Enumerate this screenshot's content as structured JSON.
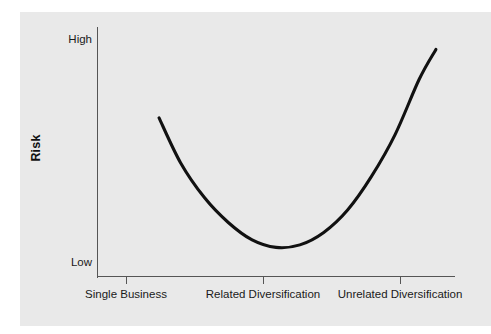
{
  "figure": {
    "background_color": "#ffffff",
    "panel_color": "#e9e9e9",
    "axis_color": "#555555",
    "curve_color": "#111111"
  },
  "axes": {
    "y_title": "Risk",
    "y_ticks": [
      {
        "label": "High"
      },
      {
        "label": "Low"
      }
    ],
    "x_ticks": [
      {
        "label": "Single Business"
      },
      {
        "label": "Related Diversification"
      },
      {
        "label": "Unrelated Diversification"
      }
    ]
  },
  "chart_data": {
    "type": "line",
    "title": "",
    "xlabel": "",
    "ylabel": "Risk",
    "grid": false,
    "legend": null,
    "xlim": [
      0,
      3
    ],
    "ylim": [
      0,
      1
    ],
    "x_tick_labels": [
      "Single Business",
      "Related Diversification",
      "Unrelated Diversification"
    ],
    "x_tick_positions": [
      0.5,
      1.5,
      2.5
    ],
    "y_tick_labels": [
      "Low",
      "High"
    ],
    "y_tick_positions": [
      0.06,
      1.0
    ],
    "series": [
      {
        "name": "Risk vs. Diversification",
        "comment": "U-shaped curve: risk is high for a single business, lowest at related diversification, and highest for unrelated diversification",
        "x": [
          0.52,
          0.7,
          0.9,
          1.1,
          1.3,
          1.5,
          1.7,
          1.9,
          2.1,
          2.3,
          2.5,
          2.7,
          2.84
        ],
        "y": [
          0.635,
          0.455,
          0.315,
          0.215,
          0.145,
          0.115,
          0.125,
          0.175,
          0.265,
          0.4,
          0.57,
          0.79,
          0.91
        ]
      }
    ],
    "annotations": [
      {
        "text": "minimum risk at Related Diversification",
        "x": 1.55,
        "y": 0.115
      }
    ]
  }
}
